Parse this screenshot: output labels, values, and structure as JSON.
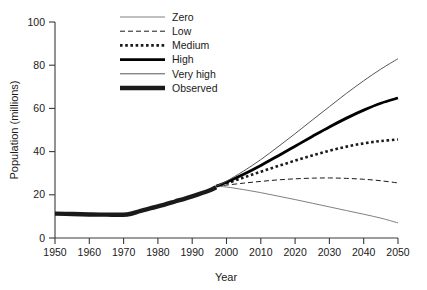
{
  "chart_data": {
    "type": "line",
    "title": "",
    "xlabel": "Year",
    "ylabel": "Population (millions)",
    "xlim": [
      1950,
      2050
    ],
    "ylim": [
      0,
      100
    ],
    "xticks": [
      1950,
      1960,
      1970,
      1980,
      1990,
      2000,
      2010,
      2020,
      2030,
      2040,
      2050
    ],
    "yticks": [
      0,
      20,
      40,
      60,
      80,
      100
    ],
    "grid": false,
    "legend_position": "top-left-inside",
    "branch_year": 1997,
    "branch_value": 24,
    "series": [
      {
        "name": "Zero",
        "style": "thin-solid-gray",
        "color": "#808080",
        "x": [
          1997,
          2000,
          2005,
          2010,
          2015,
          2020,
          2025,
          2030,
          2035,
          2040,
          2045,
          2050
        ],
        "values": [
          24,
          23.6,
          22.4,
          21.0,
          19.4,
          17.8,
          16.1,
          14.4,
          12.7,
          11.0,
          9.2,
          7.0
        ]
      },
      {
        "name": "Low",
        "style": "dashed",
        "color": "#1a1a1a",
        "x": [
          1997,
          2000,
          2005,
          2010,
          2015,
          2020,
          2025,
          2030,
          2035,
          2040,
          2045,
          2050
        ],
        "values": [
          24,
          24.5,
          25.4,
          26.2,
          26.9,
          27.4,
          27.7,
          27.8,
          27.6,
          27.2,
          26.5,
          25.5
        ]
      },
      {
        "name": "Medium",
        "style": "dotted",
        "color": "#1a1a1a",
        "x": [
          1997,
          2000,
          2005,
          2010,
          2015,
          2020,
          2025,
          2030,
          2035,
          2040,
          2045,
          2050
        ],
        "values": [
          24,
          25.3,
          28.0,
          30.7,
          33.3,
          35.8,
          38.2,
          40.4,
          42.3,
          43.8,
          44.9,
          45.6
        ]
      },
      {
        "name": "High",
        "style": "thick-solid-black",
        "color": "#000000",
        "x": [
          1997,
          2000,
          2005,
          2010,
          2015,
          2020,
          2025,
          2030,
          2035,
          2040,
          2045,
          2050
        ],
        "values": [
          24,
          25.8,
          29.5,
          33.6,
          38.0,
          42.5,
          47.0,
          51.4,
          55.5,
          59.2,
          62.4,
          64.8
        ]
      },
      {
        "name": "Very high",
        "style": "thin-solid-gray",
        "color": "#555555",
        "x": [
          1997,
          2000,
          2005,
          2010,
          2015,
          2020,
          2025,
          2030,
          2035,
          2040,
          2045,
          2050
        ],
        "values": [
          24,
          26.3,
          31.0,
          36.3,
          42.2,
          48.3,
          54.6,
          60.8,
          67.0,
          72.8,
          78.2,
          83.0
        ]
      },
      {
        "name": "Observed",
        "style": "very-thick-black",
        "color": "#1a1a1a",
        "x": [
          1950,
          1955,
          1960,
          1965,
          1971,
          1975,
          1980,
          1985,
          1990,
          1995,
          1997
        ],
        "values": [
          11.3,
          11.1,
          10.9,
          10.8,
          10.9,
          12.6,
          14.6,
          16.9,
          19.3,
          22.0,
          23.5
        ]
      }
    ]
  },
  "legend": {
    "items": [
      {
        "label": "Zero"
      },
      {
        "label": "Low"
      },
      {
        "label": "Medium"
      },
      {
        "label": "High"
      },
      {
        "label": "Very high"
      },
      {
        "label": "Observed"
      }
    ]
  },
  "axes": {
    "x_title": "Year",
    "y_title": "Population (millions)",
    "x_tick_labels": [
      "1950",
      "1960",
      "1970",
      "1980",
      "1990",
      "2000",
      "2010",
      "2020",
      "2030",
      "2040",
      "2050"
    ],
    "y_tick_labels": [
      "0",
      "20",
      "40",
      "60",
      "80",
      "100"
    ]
  }
}
